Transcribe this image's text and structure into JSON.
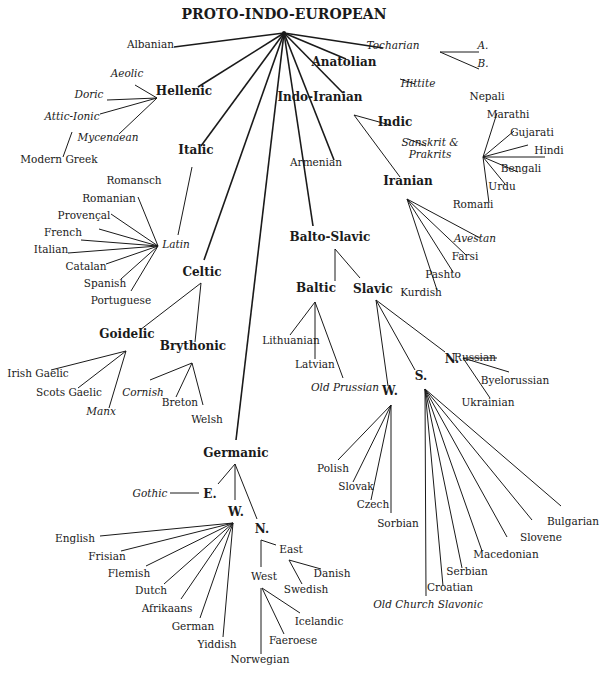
{
  "title": "PROTO-INDO-EUROPEAN",
  "colors": {
    "ink": "#1a1a1a",
    "background": "#ffffff"
  },
  "nodes": [
    {
      "id": "pie",
      "label": "PROTO-INDO-EUROPEAN",
      "x": 284,
      "y": 12,
      "kind": "root",
      "align": "center"
    },
    {
      "id": "albanian",
      "label": "Albanian",
      "x": 128,
      "y": 44,
      "kind": "leaf",
      "align": "left"
    },
    {
      "id": "tocharian",
      "label": "Tocharian",
      "x": 393,
      "y": 45,
      "kind": "leaf",
      "italic": true
    },
    {
      "id": "tochA",
      "label": "A.",
      "x": 483,
      "y": 45,
      "kind": "leaf",
      "italic": true
    },
    {
      "id": "tochB",
      "label": "B.",
      "x": 483,
      "y": 63,
      "kind": "leaf",
      "italic": true
    },
    {
      "id": "anatolian",
      "label": "Anatolian",
      "x": 344,
      "y": 61,
      "kind": "group"
    },
    {
      "id": "hittite",
      "label": "Hittite",
      "x": 418,
      "y": 83,
      "kind": "leaf",
      "italic": true
    },
    {
      "id": "indoiranian",
      "label": "Indo-Iranian",
      "x": 320,
      "y": 96,
      "kind": "group"
    },
    {
      "id": "indic",
      "label": "Indic",
      "x": 395,
      "y": 121,
      "kind": "group"
    },
    {
      "id": "sanskrit",
      "label": "Sanskrit &\nPrakrits",
      "x": 430,
      "y": 142,
      "kind": "leaf",
      "italic": true
    },
    {
      "id": "nepali",
      "label": "Nepali",
      "x": 487,
      "y": 96,
      "kind": "leaf"
    },
    {
      "id": "marathi",
      "label": "Marathi",
      "x": 508,
      "y": 114,
      "kind": "leaf"
    },
    {
      "id": "gujarati",
      "label": "Gujarati",
      "x": 532,
      "y": 132,
      "kind": "leaf"
    },
    {
      "id": "hindi",
      "label": "Hindi",
      "x": 549,
      "y": 150,
      "kind": "leaf"
    },
    {
      "id": "bengali",
      "label": "Bengali",
      "x": 521,
      "y": 168,
      "kind": "leaf"
    },
    {
      "id": "urdu",
      "label": "Urdu",
      "x": 502,
      "y": 186,
      "kind": "leaf"
    },
    {
      "id": "romani",
      "label": "Romani",
      "x": 473,
      "y": 204,
      "kind": "leaf"
    },
    {
      "id": "armenian",
      "label": "Armenian",
      "x": 316,
      "y": 162,
      "kind": "leaf"
    },
    {
      "id": "iranian",
      "label": "Iranian",
      "x": 408,
      "y": 180,
      "kind": "group"
    },
    {
      "id": "avestan",
      "label": "Avestan",
      "x": 475,
      "y": 238,
      "kind": "leaf",
      "italic": true
    },
    {
      "id": "farsi",
      "label": "Farsi",
      "x": 465,
      "y": 256,
      "kind": "leaf"
    },
    {
      "id": "pashto",
      "label": "Pashto",
      "x": 443,
      "y": 274,
      "kind": "leaf"
    },
    {
      "id": "kurdish",
      "label": "Kurdish",
      "x": 421,
      "y": 292,
      "kind": "leaf"
    },
    {
      "id": "hellenic",
      "label": "Hellenic",
      "x": 184,
      "y": 90,
      "kind": "group"
    },
    {
      "id": "aeolic",
      "label": "Aeolic",
      "x": 127,
      "y": 73,
      "kind": "leaf",
      "italic": true
    },
    {
      "id": "doric",
      "label": "Doric",
      "x": 89,
      "y": 94,
      "kind": "leaf",
      "italic": true
    },
    {
      "id": "atticionic",
      "label": "Attic-Ionic",
      "x": 72,
      "y": 116,
      "kind": "leaf",
      "italic": true
    },
    {
      "id": "mycenaean",
      "label": "Mycenaean",
      "x": 108,
      "y": 137,
      "kind": "leaf",
      "italic": true
    },
    {
      "id": "moderngreek",
      "label": "Modern Greek",
      "x": 59,
      "y": 159,
      "kind": "leaf"
    },
    {
      "id": "italic",
      "label": "Italic",
      "x": 196,
      "y": 149,
      "kind": "group"
    },
    {
      "id": "latin",
      "label": "Latin",
      "x": 176,
      "y": 244,
      "kind": "leaf",
      "italic": true
    },
    {
      "id": "romansch",
      "label": "Romansch",
      "x": 134,
      "y": 180,
      "kind": "leaf"
    },
    {
      "id": "romanian",
      "label": "Romanian",
      "x": 109,
      "y": 198,
      "kind": "leaf"
    },
    {
      "id": "provencal",
      "label": "Provençal",
      "x": 84,
      "y": 215,
      "kind": "leaf"
    },
    {
      "id": "french",
      "label": "French",
      "x": 63,
      "y": 232,
      "kind": "leaf"
    },
    {
      "id": "italian",
      "label": "Italian",
      "x": 51,
      "y": 249,
      "kind": "leaf"
    },
    {
      "id": "catalan",
      "label": "Catalan",
      "x": 86,
      "y": 266,
      "kind": "leaf"
    },
    {
      "id": "spanish",
      "label": "Spanish",
      "x": 105,
      "y": 283,
      "kind": "leaf"
    },
    {
      "id": "portuguese",
      "label": "Portuguese",
      "x": 121,
      "y": 300,
      "kind": "leaf"
    },
    {
      "id": "celtic",
      "label": "Celtic",
      "x": 202,
      "y": 271,
      "kind": "group"
    },
    {
      "id": "goidelic",
      "label": "Goidelic",
      "x": 127,
      "y": 333,
      "kind": "group"
    },
    {
      "id": "brythonic",
      "label": "Brythonic",
      "x": 193,
      "y": 345,
      "kind": "group"
    },
    {
      "id": "irishgaelic",
      "label": "Irish Gaelic",
      "x": 38,
      "y": 373,
      "kind": "leaf"
    },
    {
      "id": "scotsgaelic",
      "label": "Scots Gaelic",
      "x": 69,
      "y": 392,
      "kind": "leaf"
    },
    {
      "id": "manx",
      "label": "Manx",
      "x": 101,
      "y": 411,
      "kind": "leaf",
      "italic": true
    },
    {
      "id": "cornish",
      "label": "Cornish",
      "x": 143,
      "y": 392,
      "kind": "leaf",
      "italic": true
    },
    {
      "id": "breton",
      "label": "Breton",
      "x": 180,
      "y": 402,
      "kind": "leaf"
    },
    {
      "id": "welsh",
      "label": "Welsh",
      "x": 207,
      "y": 419,
      "kind": "leaf"
    },
    {
      "id": "baltoslavic",
      "label": "Balto-Slavic",
      "x": 330,
      "y": 236,
      "kind": "group"
    },
    {
      "id": "baltic",
      "label": "Baltic",
      "x": 316,
      "y": 287,
      "kind": "group"
    },
    {
      "id": "slavic",
      "label": "Slavic",
      "x": 373,
      "y": 288,
      "kind": "group"
    },
    {
      "id": "lithuanian",
      "label": "Lithuanian",
      "x": 291,
      "y": 340,
      "kind": "leaf"
    },
    {
      "id": "latvian",
      "label": "Latvian",
      "x": 315,
      "y": 364,
      "kind": "leaf"
    },
    {
      "id": "oldprussian",
      "label": "Old Prussian",
      "x": 345,
      "y": 387,
      "kind": "leaf",
      "italic": true
    },
    {
      "id": "slavW",
      "label": "W.",
      "x": 390,
      "y": 390,
      "kind": "group"
    },
    {
      "id": "slavS",
      "label": "S.",
      "x": 421,
      "y": 375,
      "kind": "group"
    },
    {
      "id": "slavN",
      "label": "N.",
      "x": 452,
      "y": 358,
      "kind": "group"
    },
    {
      "id": "russian",
      "label": "Russian",
      "x": 475,
      "y": 357,
      "kind": "leaf"
    },
    {
      "id": "byelorussian",
      "label": "Byelorussian",
      "x": 515,
      "y": 380,
      "kind": "leaf"
    },
    {
      "id": "ukrainian",
      "label": "Ukrainian",
      "x": 488,
      "y": 402,
      "kind": "leaf"
    },
    {
      "id": "polish",
      "label": "Polish",
      "x": 333,
      "y": 468,
      "kind": "leaf"
    },
    {
      "id": "slovak",
      "label": "Slovak",
      "x": 356,
      "y": 486,
      "kind": "leaf"
    },
    {
      "id": "czech",
      "label": "Czech",
      "x": 373,
      "y": 504,
      "kind": "leaf"
    },
    {
      "id": "sorbian",
      "label": "Sorbian",
      "x": 398,
      "y": 523,
      "kind": "leaf"
    },
    {
      "id": "bulgarian",
      "label": "Bulgarian",
      "x": 573,
      "y": 521,
      "kind": "leaf"
    },
    {
      "id": "slovene",
      "label": "Slovene",
      "x": 541,
      "y": 537,
      "kind": "leaf"
    },
    {
      "id": "macedonian",
      "label": "Macedonian",
      "x": 506,
      "y": 554,
      "kind": "leaf"
    },
    {
      "id": "serbian",
      "label": "Serbian",
      "x": 467,
      "y": 571,
      "kind": "leaf"
    },
    {
      "id": "croatian",
      "label": "Croatian",
      "x": 450,
      "y": 587,
      "kind": "leaf"
    },
    {
      "id": "ocs",
      "label": "Old Church Slavonic",
      "x": 428,
      "y": 604,
      "kind": "leaf",
      "italic": true
    },
    {
      "id": "germanic",
      "label": "Germanic",
      "x": 236,
      "y": 452,
      "kind": "group"
    },
    {
      "id": "germE",
      "label": "E.",
      "x": 210,
      "y": 493,
      "kind": "group"
    },
    {
      "id": "gothic",
      "label": "Gothic",
      "x": 150,
      "y": 493,
      "kind": "leaf",
      "italic": true
    },
    {
      "id": "germW",
      "label": "W.",
      "x": 236,
      "y": 511,
      "kind": "group"
    },
    {
      "id": "germN",
      "label": "N.",
      "x": 262,
      "y": 528,
      "kind": "group"
    },
    {
      "id": "english",
      "label": "English",
      "x": 75,
      "y": 538,
      "kind": "leaf"
    },
    {
      "id": "frisian",
      "label": "Frisian",
      "x": 107,
      "y": 556,
      "kind": "leaf"
    },
    {
      "id": "flemish",
      "label": "Flemish",
      "x": 129,
      "y": 573,
      "kind": "leaf"
    },
    {
      "id": "dutch",
      "label": "Dutch",
      "x": 151,
      "y": 590,
      "kind": "leaf"
    },
    {
      "id": "afrikaans",
      "label": "Afrikaans",
      "x": 167,
      "y": 608,
      "kind": "leaf"
    },
    {
      "id": "german",
      "label": "German",
      "x": 193,
      "y": 626,
      "kind": "leaf"
    },
    {
      "id": "yiddish",
      "label": "Yiddish",
      "x": 217,
      "y": 644,
      "kind": "leaf"
    },
    {
      "id": "east",
      "label": "East",
      "x": 291,
      "y": 549,
      "kind": "leaf"
    },
    {
      "id": "west",
      "label": "West",
      "x": 264,
      "y": 576,
      "kind": "leaf"
    },
    {
      "id": "danish",
      "label": "Danish",
      "x": 332,
      "y": 573,
      "kind": "leaf"
    },
    {
      "id": "swedish",
      "label": "Swedish",
      "x": 306,
      "y": 589,
      "kind": "leaf"
    },
    {
      "id": "icelandic",
      "label": "Icelandic",
      "x": 319,
      "y": 621,
      "kind": "leaf"
    },
    {
      "id": "faeroese",
      "label": "Faeroese",
      "x": 293,
      "y": 640,
      "kind": "leaf"
    },
    {
      "id": "norwegian",
      "label": "Norwegian",
      "x": 260,
      "y": 659,
      "kind": "leaf"
    }
  ],
  "edges": [
    {
      "root": true,
      "x1": 284,
      "y1": 33,
      "x2": 174,
      "y2": 47
    },
    {
      "root": true,
      "x1": 284,
      "y1": 33,
      "x2": 383,
      "y2": 48
    },
    {
      "root": true,
      "x1": 284,
      "y1": 33,
      "x2": 346,
      "y2": 59
    },
    {
      "root": true,
      "x1": 284,
      "y1": 33,
      "x2": 343,
      "y2": 93
    },
    {
      "root": true,
      "x1": 284,
      "y1": 33,
      "x2": 198,
      "y2": 87
    },
    {
      "root": true,
      "x1": 284,
      "y1": 33,
      "x2": 201,
      "y2": 146
    },
    {
      "root": true,
      "x1": 284,
      "y1": 33,
      "x2": 204,
      "y2": 260
    },
    {
      "root": true,
      "x1": 284,
      "y1": 33,
      "x2": 236,
      "y2": 440
    },
    {
      "root": true,
      "x1": 284,
      "y1": 33,
      "x2": 313,
      "y2": 226
    },
    {
      "root": true,
      "x1": 284,
      "y1": 33,
      "x2": 334,
      "y2": 160
    },
    {
      "x1": 440,
      "y1": 52,
      "x2": 479,
      "y2": 52
    },
    {
      "x1": 440,
      "y1": 52,
      "x2": 479,
      "y2": 69
    },
    {
      "x1": 400,
      "y1": 79,
      "x2": 415,
      "y2": 84
    },
    {
      "x1": 354,
      "y1": 115,
      "x2": 390,
      "y2": 125
    },
    {
      "x1": 354,
      "y1": 115,
      "x2": 400,
      "y2": 177
    },
    {
      "x1": 408,
      "y1": 139,
      "x2": 426,
      "y2": 146
    },
    {
      "x1": 483,
      "y1": 157,
      "x2": 497,
      "y2": 113
    },
    {
      "x1": 483,
      "y1": 157,
      "x2": 514,
      "y2": 131
    },
    {
      "x1": 483,
      "y1": 157,
      "x2": 528,
      "y2": 145
    },
    {
      "x1": 483,
      "y1": 157,
      "x2": 545,
      "y2": 157
    },
    {
      "x1": 483,
      "y1": 157,
      "x2": 518,
      "y2": 172
    },
    {
      "x1": 483,
      "y1": 157,
      "x2": 505,
      "y2": 184
    },
    {
      "x1": 483,
      "y1": 157,
      "x2": 489,
      "y2": 203
    },
    {
      "x1": 407,
      "y1": 199,
      "x2": 480,
      "y2": 238
    },
    {
      "x1": 407,
      "y1": 199,
      "x2": 466,
      "y2": 255
    },
    {
      "x1": 407,
      "y1": 199,
      "x2": 453,
      "y2": 272
    },
    {
      "x1": 407,
      "y1": 199,
      "x2": 437,
      "y2": 290
    },
    {
      "x1": 157,
      "y1": 98,
      "x2": 135,
      "y2": 85
    },
    {
      "x1": 157,
      "y1": 98,
      "x2": 107,
      "y2": 100
    },
    {
      "x1": 157,
      "y1": 98,
      "x2": 100,
      "y2": 114
    },
    {
      "x1": 157,
      "y1": 98,
      "x2": 119,
      "y2": 134
    },
    {
      "x1": 72,
      "y1": 132,
      "x2": 63,
      "y2": 157
    },
    {
      "x1": 192,
      "y1": 167,
      "x2": 178,
      "y2": 235
    },
    {
      "x1": 158,
      "y1": 246,
      "x2": 138,
      "y2": 197
    },
    {
      "x1": 158,
      "y1": 246,
      "x2": 111,
      "y2": 214
    },
    {
      "x1": 158,
      "y1": 246,
      "x2": 99,
      "y2": 229
    },
    {
      "x1": 158,
      "y1": 246,
      "x2": 81,
      "y2": 240
    },
    {
      "x1": 158,
      "y1": 246,
      "x2": 68,
      "y2": 253
    },
    {
      "x1": 158,
      "y1": 246,
      "x2": 106,
      "y2": 264
    },
    {
      "x1": 158,
      "y1": 246,
      "x2": 121,
      "y2": 279
    },
    {
      "x1": 158,
      "y1": 246,
      "x2": 131,
      "y2": 291
    },
    {
      "x1": 201,
      "y1": 283,
      "x2": 140,
      "y2": 330
    },
    {
      "x1": 201,
      "y1": 283,
      "x2": 195,
      "y2": 342
    },
    {
      "x1": 126,
      "y1": 351,
      "x2": 51,
      "y2": 370
    },
    {
      "x1": 126,
      "y1": 351,
      "x2": 78,
      "y2": 388
    },
    {
      "x1": 126,
      "y1": 351,
      "x2": 109,
      "y2": 408
    },
    {
      "x1": 192,
      "y1": 363,
      "x2": 150,
      "y2": 380
    },
    {
      "x1": 192,
      "y1": 363,
      "x2": 176,
      "y2": 397
    },
    {
      "x1": 192,
      "y1": 363,
      "x2": 203,
      "y2": 405
    },
    {
      "x1": 335,
      "y1": 249,
      "x2": 335,
      "y2": 281
    },
    {
      "x1": 335,
      "y1": 249,
      "x2": 360,
      "y2": 278
    },
    {
      "x1": 315,
      "y1": 302,
      "x2": 290,
      "y2": 335
    },
    {
      "x1": 315,
      "y1": 302,
      "x2": 315,
      "y2": 359
    },
    {
      "x1": 315,
      "y1": 302,
      "x2": 343,
      "y2": 378
    },
    {
      "x1": 376,
      "y1": 300,
      "x2": 388,
      "y2": 386
    },
    {
      "x1": 376,
      "y1": 300,
      "x2": 415,
      "y2": 370
    },
    {
      "x1": 376,
      "y1": 300,
      "x2": 445,
      "y2": 352
    },
    {
      "x1": 463,
      "y1": 358,
      "x2": 497,
      "y2": 358
    },
    {
      "x1": 463,
      "y1": 358,
      "x2": 509,
      "y2": 372
    },
    {
      "x1": 463,
      "y1": 358,
      "x2": 490,
      "y2": 398
    },
    {
      "x1": 391,
      "y1": 405,
      "x2": 338,
      "y2": 460
    },
    {
      "x1": 391,
      "y1": 405,
      "x2": 353,
      "y2": 482
    },
    {
      "x1": 391,
      "y1": 405,
      "x2": 371,
      "y2": 500
    },
    {
      "x1": 391,
      "y1": 405,
      "x2": 391,
      "y2": 513
    },
    {
      "x1": 425,
      "y1": 389,
      "x2": 426,
      "y2": 596
    },
    {
      "x1": 425,
      "y1": 389,
      "x2": 443,
      "y2": 586
    },
    {
      "x1": 425,
      "y1": 389,
      "x2": 462,
      "y2": 568
    },
    {
      "x1": 425,
      "y1": 389,
      "x2": 482,
      "y2": 551
    },
    {
      "x1": 425,
      "y1": 389,
      "x2": 507,
      "y2": 537
    },
    {
      "x1": 425,
      "y1": 389,
      "x2": 532,
      "y2": 520
    },
    {
      "x1": 425,
      "y1": 389,
      "x2": 561,
      "y2": 506
    },
    {
      "x1": 235,
      "y1": 464,
      "x2": 218,
      "y2": 484
    },
    {
      "x1": 235,
      "y1": 464,
      "x2": 235,
      "y2": 500
    },
    {
      "x1": 235,
      "y1": 464,
      "x2": 257,
      "y2": 519
    },
    {
      "x1": 170,
      "y1": 493,
      "x2": 199,
      "y2": 493
    },
    {
      "x1": 233,
      "y1": 523,
      "x2": 100,
      "y2": 536
    },
    {
      "x1": 233,
      "y1": 523,
      "x2": 121,
      "y2": 551
    },
    {
      "x1": 233,
      "y1": 523,
      "x2": 146,
      "y2": 566
    },
    {
      "x1": 233,
      "y1": 523,
      "x2": 164,
      "y2": 584
    },
    {
      "x1": 233,
      "y1": 523,
      "x2": 181,
      "y2": 599
    },
    {
      "x1": 233,
      "y1": 523,
      "x2": 200,
      "y2": 618
    },
    {
      "x1": 233,
      "y1": 523,
      "x2": 223,
      "y2": 637
    },
    {
      "x1": 261,
      "y1": 540,
      "x2": 261,
      "y2": 567
    },
    {
      "x1": 261,
      "y1": 540,
      "x2": 276,
      "y2": 545
    },
    {
      "x1": 289,
      "y1": 560,
      "x2": 321,
      "y2": 569
    },
    {
      "x1": 289,
      "y1": 560,
      "x2": 302,
      "y2": 584
    },
    {
      "x1": 262,
      "y1": 588,
      "x2": 300,
      "y2": 613
    },
    {
      "x1": 262,
      "y1": 588,
      "x2": 284,
      "y2": 634
    },
    {
      "x1": 261,
      "y1": 588,
      "x2": 261,
      "y2": 654
    }
  ]
}
